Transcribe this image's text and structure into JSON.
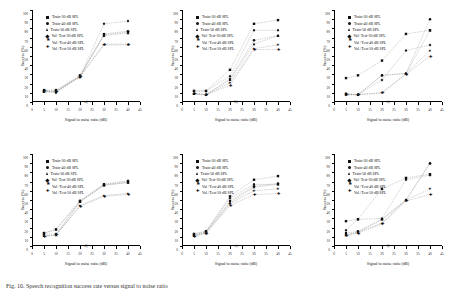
{
  "figure": {
    "caption": "Fig. 10. Speech recognition success rate versus signal to noise ratio",
    "axis": {
      "xlabel": "Signal to noise ratio (dB)",
      "ylabel": "Success (%)",
      "xticks": [
        0,
        5,
        10,
        15,
        20,
        25,
        30,
        35,
        40,
        45
      ],
      "yticks": [
        0,
        10,
        20,
        30,
        40,
        50,
        60,
        70,
        80,
        90,
        100
      ],
      "xlim": [
        0,
        45
      ],
      "ylim": [
        0,
        100
      ]
    },
    "legend_labels": [
      "Train-30 dB SPL",
      "Train-40 dB SPL",
      "Train-50 dB SPL",
      "Val+Test-30 dB SPL",
      "Val+Test-40 dB SPL",
      "Val+Test-50 dB SPL"
    ],
    "legend_markers": [
      "sq",
      "circ",
      "tri",
      "dmd",
      "star",
      "plus"
    ]
  },
  "chart_data": [
    {
      "id": "a",
      "type": "line",
      "panel_label": "a)",
      "title": "",
      "xlabel": "Signal to noise ratio (dB)",
      "ylabel": "Success (%)",
      "xlim": [
        0,
        45
      ],
      "ylim": [
        0,
        100
      ],
      "x": [
        5,
        10,
        20,
        30,
        40
      ],
      "grid": false,
      "legend_position": "upper-left",
      "series": [
        {
          "name": "Train-30 dB SPL",
          "values": [
            12,
            12,
            28,
            73,
            76
          ]
        },
        {
          "name": "Train-40 dB SPL",
          "values": [
            13,
            13,
            29,
            74,
            77
          ]
        },
        {
          "name": "Train-50 dB SPL",
          "values": [
            11,
            11,
            28,
            72,
            75
          ]
        },
        {
          "name": "Val+Test-30 dB SPL",
          "values": [
            12,
            10,
            28,
            85,
            88
          ]
        },
        {
          "name": "Val+Test-40 dB SPL",
          "values": [
            11,
            12,
            27,
            63,
            63
          ]
        },
        {
          "name": "Val+Test-50 dB SPL",
          "values": [
            12,
            11,
            28,
            62,
            62
          ]
        }
      ]
    },
    {
      "id": "b",
      "type": "line",
      "panel_label": "b)",
      "title": "",
      "xlabel": "Signal to noise ratio (dB)",
      "ylabel": "Success (%)",
      "xlim": [
        0,
        45
      ],
      "ylim": [
        0,
        100
      ],
      "x": [
        5,
        10,
        20,
        30,
        40
      ],
      "grid": false,
      "legend_position": "upper-left",
      "series": [
        {
          "name": "Train-30 dB SPL",
          "values": [
            12,
            12,
            35,
            85,
            89
          ]
        },
        {
          "name": "Train-40 dB SPL",
          "values": [
            9,
            8,
            25,
            67,
            72
          ]
        },
        {
          "name": "Train-50 dB SPL",
          "values": [
            9,
            8,
            24,
            63,
            72
          ]
        },
        {
          "name": "Val+Test-30 dB SPL",
          "values": [
            12,
            12,
            28,
            78,
            78
          ]
        },
        {
          "name": "Val+Test-40 dB SPL",
          "values": [
            9,
            8,
            21,
            58,
            62
          ]
        },
        {
          "name": "Val+Test-50 dB SPL",
          "values": [
            9,
            8,
            18,
            57,
            57
          ]
        }
      ]
    },
    {
      "id": "c",
      "type": "line",
      "panel_label": "c)",
      "title": "",
      "xlabel": "Signal to noise ratio (dB)",
      "ylabel": "Success (%)",
      "xlim": [
        0,
        45
      ],
      "ylim": [
        0,
        100
      ],
      "x": [
        5,
        10,
        20,
        30,
        40
      ],
      "grid": false,
      "legend_position": "upper-left",
      "series": [
        {
          "name": "Train-30 dB SPL",
          "values": [
            26,
            29,
            45,
            74,
            78
          ]
        },
        {
          "name": "Train-40 dB SPL",
          "values": [
            9,
            8,
            29,
            31,
            90
          ]
        },
        {
          "name": "Train-50 dB SPL",
          "values": [
            8,
            8,
            29,
            31,
            78
          ]
        },
        {
          "name": "Val+Test-30 dB SPL",
          "values": [
            9,
            8,
            24,
            56,
            62
          ]
        },
        {
          "name": "Val+Test-40 dB SPL",
          "values": [
            8,
            8,
            10,
            31,
            56
          ]
        },
        {
          "name": "Val+Test-50 dB SPL",
          "values": [
            8,
            8,
            10,
            30,
            50
          ]
        }
      ]
    },
    {
      "id": "d",
      "type": "line",
      "panel_label": "d)",
      "title": "",
      "xlabel": "Signal to noise ratio (dB)",
      "ylabel": "Success (%)",
      "xlim": [
        0,
        45
      ],
      "ylim": [
        0,
        100
      ],
      "x": [
        5,
        10,
        20,
        30,
        40
      ],
      "grid": false,
      "legend_position": "upper-left",
      "series": [
        {
          "name": "Train-30 dB SPL",
          "values": [
            14,
            18,
            49,
            67,
            70
          ]
        },
        {
          "name": "Train-40 dB SPL",
          "values": [
            13,
            13,
            48,
            66,
            69
          ]
        },
        {
          "name": "Train-50 dB SPL",
          "values": [
            11,
            12,
            48,
            66,
            69
          ]
        },
        {
          "name": "Val+Test-30 dB SPL",
          "values": [
            14,
            18,
            49,
            67,
            71
          ]
        },
        {
          "name": "Val+Test-40 dB SPL",
          "values": [
            11,
            12,
            44,
            55,
            57
          ]
        },
        {
          "name": "Val+Test-50 dB SPL",
          "values": [
            10,
            12,
            43,
            54,
            56
          ]
        }
      ]
    },
    {
      "id": "e",
      "type": "line",
      "panel_label": "e)",
      "title": "",
      "xlabel": "Signal to noise ratio (dB)",
      "ylabel": "Success (%)",
      "xlim": [
        0,
        45
      ],
      "ylim": [
        0,
        100
      ],
      "x": [
        5,
        10,
        20,
        30,
        40
      ],
      "grid": false,
      "legend_position": "upper-left",
      "series": [
        {
          "name": "Train-30 dB SPL",
          "values": [
            13,
            16,
            54,
            72,
            76
          ]
        },
        {
          "name": "Train-40 dB SPL",
          "values": [
            12,
            15,
            49,
            65,
            68
          ]
        },
        {
          "name": "Train-50 dB SPL",
          "values": [
            11,
            15,
            47,
            64,
            67
          ]
        },
        {
          "name": "Val+Test-30 dB SPL",
          "values": [
            13,
            16,
            52,
            67,
            67
          ]
        },
        {
          "name": "Val+Test-40 dB SPL",
          "values": [
            11,
            14,
            46,
            60,
            62
          ]
        },
        {
          "name": "Val+Test-50 dB SPL",
          "values": [
            10,
            14,
            44,
            56,
            57
          ]
        }
      ]
    },
    {
      "id": "f",
      "type": "line",
      "panel_label": "f)",
      "title": "",
      "xlabel": "Signal to noise ratio (dB)",
      "ylabel": "Success (%)",
      "xlim": [
        0,
        45
      ],
      "ylim": [
        0,
        100
      ],
      "x": [
        5,
        10,
        20,
        30,
        40
      ],
      "grid": false,
      "legend_position": "upper-left",
      "series": [
        {
          "name": "Train-30 dB SPL",
          "values": [
            27,
            29,
            62,
            74,
            78
          ]
        },
        {
          "name": "Train-40 dB SPL",
          "values": [
            14,
            16,
            29,
            50,
            90
          ]
        },
        {
          "name": "Train-50 dB SPL",
          "values": [
            12,
            15,
            29,
            50,
            90
          ]
        },
        {
          "name": "Val+Test-30 dB SPL",
          "values": [
            17,
            29,
            30,
            72,
            77
          ]
        },
        {
          "name": "Val+Test-40 dB SPL",
          "values": [
            12,
            15,
            25,
            50,
            62
          ]
        },
        {
          "name": "Val+Test-50 dB SPL",
          "values": [
            11,
            14,
            24,
            49,
            56
          ]
        }
      ]
    }
  ]
}
